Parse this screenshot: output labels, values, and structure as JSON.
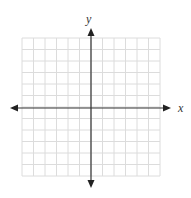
{
  "diagram": {
    "type": "coordinate-plane",
    "grid": {
      "columns": 12,
      "rows": 12,
      "left": 22,
      "top": 38,
      "cell": 11.5,
      "line_color": "#dcdcdc"
    },
    "axes": {
      "color": "#333333",
      "x_label": "x",
      "y_label": "y",
      "origin_col": 6,
      "origin_row": 6
    }
  }
}
